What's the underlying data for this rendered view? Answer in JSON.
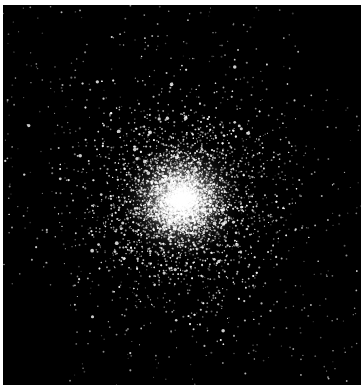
{
  "image": {
    "subject": "globular star cluster",
    "background": "#000000",
    "border_color": "#ffffff",
    "width": 361,
    "height": 385,
    "cluster_center": {
      "x": 181,
      "y": 200
    },
    "core_radius": 22,
    "halo_radius": 140,
    "star_count": 9000,
    "field_star_count": 500,
    "bright_star_count": 120,
    "empty_regions": [
      {
        "name": "lower-left-corner",
        "x": 0,
        "y": 295,
        "w": 70,
        "h": 90
      },
      {
        "name": "upper-right-corner",
        "x": 300,
        "y": 0,
        "w": 61,
        "h": 90
      }
    ]
  }
}
